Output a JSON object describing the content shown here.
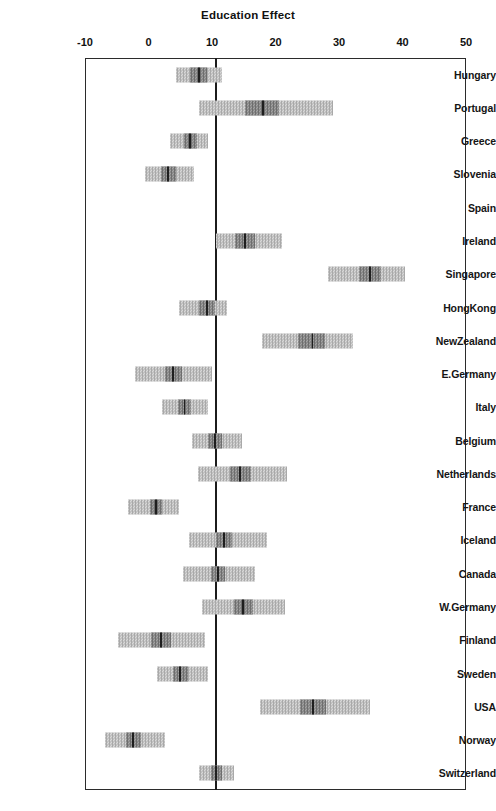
{
  "chart_data": {
    "type": "bar",
    "title": "Education Effect",
    "xlabel": "",
    "ylabel": "",
    "xlim": [
      -10,
      50
    ],
    "xticks": [
      -10,
      0,
      10,
      20,
      30,
      40,
      50
    ],
    "xtick_labels": [
      "-10",
      "0",
      "10",
      "20",
      "30",
      "40",
      "50"
    ],
    "grid": false,
    "legend": "none",
    "reference_line": 10.6,
    "orientation": "horizontal",
    "categories": [
      "Hungary",
      "Portugal",
      "Greece",
      "Slovenia",
      "Spain",
      "Ireland",
      "Singapore",
      "HongKong",
      "NewZealand",
      "E.Germany",
      "Italy",
      "Belgium",
      "Netherlands",
      "France",
      "Iceland",
      "Canada",
      "W.Germany",
      "Finland",
      "Sweden",
      "USA",
      "Norway",
      "Switzerland"
    ],
    "series": [
      {
        "name": "Education Effect estimate with confidence intervals",
        "points": [
          {
            "category": "Hungary",
            "estimate": 8.0,
            "inner_low": 6.6,
            "inner_high": 9.2,
            "outer_low": 4.4,
            "outer_high": 11.5
          },
          {
            "category": "Portugal",
            "estimate": 18.0,
            "inner_low": 15.2,
            "inner_high": 20.5,
            "outer_low": 8.0,
            "outer_high": 29.0
          },
          {
            "category": "Greece",
            "estimate": 6.5,
            "inner_low": 5.6,
            "inner_high": 7.6,
            "outer_low": 3.4,
            "outer_high": 9.4
          },
          {
            "category": "Slovenia",
            "estimate": 3.1,
            "inner_low": 1.9,
            "inner_high": 4.3,
            "outer_low": -0.5,
            "outer_high": 7.2
          },
          {
            "category": "Spain",
            "estimate": null,
            "inner_low": null,
            "inner_high": null,
            "outer_low": null,
            "outer_high": null
          },
          {
            "category": "Ireland",
            "estimate": 15.2,
            "inner_low": 13.6,
            "inner_high": 16.8,
            "outer_low": 10.6,
            "outer_high": 21.0
          },
          {
            "category": "Singapore",
            "estimate": 34.9,
            "inner_low": 33.2,
            "inner_high": 36.6,
            "outer_low": 28.3,
            "outer_high": 40.4
          },
          {
            "category": "HongKong",
            "estimate": 9.2,
            "inner_low": 7.9,
            "inner_high": 10.4,
            "outer_low": 4.8,
            "outer_high": 12.4
          },
          {
            "category": "NewZealand",
            "estimate": 25.8,
            "inner_low": 23.6,
            "inner_high": 27.8,
            "outer_low": 17.9,
            "outer_high": 32.2
          },
          {
            "category": "E.Germany",
            "estimate": 3.9,
            "inner_low": 2.6,
            "inner_high": 5.2,
            "outer_low": -2.1,
            "outer_high": 10.0
          },
          {
            "category": "Italy",
            "estimate": 5.7,
            "inner_low": 4.7,
            "inner_high": 6.7,
            "outer_low": 2.1,
            "outer_high": 9.4
          },
          {
            "category": "Belgium",
            "estimate": 10.5,
            "inner_low": 9.4,
            "inner_high": 11.6,
            "outer_low": 6.9,
            "outer_high": 14.7
          },
          {
            "category": "Netherlands",
            "estimate": 14.4,
            "inner_low": 12.8,
            "inner_high": 16.2,
            "outer_low": 7.8,
            "outer_high": 21.8
          },
          {
            "category": "France",
            "estimate": 1.2,
            "inner_low": 0.2,
            "inner_high": 2.2,
            "outer_low": -3.2,
            "outer_high": 4.8
          },
          {
            "category": "Iceland",
            "estimate": 11.9,
            "inner_low": 10.6,
            "inner_high": 13.2,
            "outer_low": 6.4,
            "outer_high": 18.7
          },
          {
            "category": "Canada",
            "estimate": 10.9,
            "inner_low": 9.8,
            "inner_high": 12.1,
            "outer_low": 5.4,
            "outer_high": 16.8
          },
          {
            "category": "W.Germany",
            "estimate": 14.9,
            "inner_low": 13.4,
            "inner_high": 16.4,
            "outer_low": 8.4,
            "outer_high": 21.5
          },
          {
            "category": "Finland",
            "estimate": 2.0,
            "inner_low": 0.4,
            "inner_high": 3.6,
            "outer_low": -4.8,
            "outer_high": 8.9
          },
          {
            "category": "Sweden",
            "estimate": 5.0,
            "inner_low": 3.8,
            "inner_high": 6.2,
            "outer_low": 1.4,
            "outer_high": 9.4
          },
          {
            "category": "USA",
            "estimate": 25.9,
            "inner_low": 23.8,
            "inner_high": 28.0,
            "outer_low": 17.6,
            "outer_high": 34.9
          },
          {
            "category": "Norway",
            "estimate": -2.4,
            "inner_low": -3.6,
            "inner_high": -1.2,
            "outer_low": -6.8,
            "outer_high": 2.6
          },
          {
            "category": "Switzerland",
            "estimate": 10.6,
            "inner_low": 9.8,
            "inner_high": 11.5,
            "outer_low": 8.0,
            "outer_high": 13.4
          }
        ]
      }
    ]
  },
  "colors": {
    "axis": "#2b2b2b",
    "reference_line": "#1c1c1c",
    "interval_outer": "#c9c9c9",
    "interval_inner": "#8a8a8a",
    "estimate_marker": "#1f1f1f",
    "text": "#151515"
  }
}
